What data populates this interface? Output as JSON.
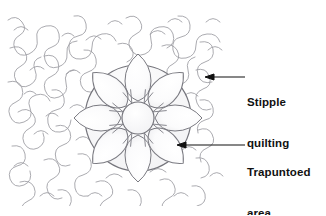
{
  "figure": {
    "background_color": "#ffffff",
    "ink_color": "#7d7d82",
    "annotation_color": "#111111"
  },
  "labels": [
    {
      "name": "stipple-quilting",
      "line1": "Stipple",
      "line2": "quilting",
      "arrow": {
        "tip_x": 206,
        "tip_y": 77,
        "tail_x": 245,
        "tail_y": 77,
        "direction": "left"
      }
    },
    {
      "name": "trapuntoed-area",
      "line1": "Trapuntoed",
      "line2": "area",
      "arrow": {
        "tip_x": 178,
        "tip_y": 145,
        "tail_x": 245,
        "tail_y": 145,
        "direction": "left"
      }
    }
  ],
  "quilt": {
    "fabric_bounds": {
      "x": 6,
      "y": 14,
      "width": 220,
      "height": 192
    },
    "stipple": {
      "name": "stipple-quilting-texture",
      "description": "dense meandering puzzle-piece stitch lines",
      "stroke": "#8a8a90",
      "stroke_width": 0.9
    },
    "medallion": {
      "name": "trapuntoed-flower-medallion",
      "center_x": 138,
      "center_y": 118,
      "outer_radius": 53,
      "petal_count": 8,
      "center_circle_radius": 16,
      "stroke": "#75757c",
      "fill": "#fbfbfc"
    }
  }
}
